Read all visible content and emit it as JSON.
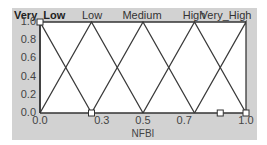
{
  "chart_data": {
    "type": "line",
    "title": "",
    "xlabel": "NFBI",
    "ylabel": "",
    "xlim": [
      0.0,
      1.0
    ],
    "ylim": [
      0.0,
      1.0
    ],
    "grid": false,
    "legend_position": "top",
    "x_ticks": [
      "0.0",
      "0.3",
      "0.5",
      "0.7",
      "1.0"
    ],
    "x_tick_values": [
      0.0,
      0.3,
      0.5,
      0.7,
      1.0
    ],
    "y_ticks": [
      "0.0",
      "0.2",
      "0.4",
      "0.6",
      "0.8",
      "1.0"
    ],
    "selected_series": "Very_Low",
    "series": [
      {
        "name": "Very_Low",
        "x": [
          0.0,
          0.0,
          0.25
        ],
        "y": [
          0,
          1,
          0
        ]
      },
      {
        "name": "Low",
        "x": [
          0.0,
          0.25,
          0.5
        ],
        "y": [
          0,
          1,
          0
        ]
      },
      {
        "name": "Medium",
        "x": [
          0.25,
          0.5,
          0.75
        ],
        "y": [
          0,
          1,
          0
        ]
      },
      {
        "name": "High",
        "x": [
          0.5,
          0.75,
          1.0
        ],
        "y": [
          0,
          1,
          0
        ]
      },
      {
        "name": "Very_High",
        "x": [
          0.75,
          1.0,
          1.0
        ],
        "y": [
          0,
          1,
          0
        ]
      }
    ],
    "handles": [
      {
        "x": 0.0,
        "y": 1.0
      },
      {
        "x": 0.25,
        "y": 0.0
      },
      {
        "x": 0.875,
        "y": 0.0
      },
      {
        "x": 1.0,
        "y": 0.0
      }
    ],
    "colors": {
      "panel": "#d2d2d2",
      "plot_bg": "#ffffff",
      "line": "#3a3a3a"
    }
  }
}
